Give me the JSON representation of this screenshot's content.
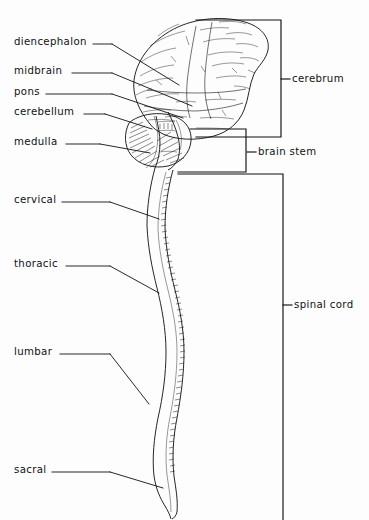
{
  "figure": {
    "background_color": "#fdfdfd",
    "ink_color": "#1a1a1a",
    "width": 369,
    "height": 520
  },
  "left_labels": [
    {
      "id": "diencephalon",
      "text": "diencephalon",
      "x": 14,
      "y": 42,
      "dash_x1": 93,
      "dash_x2": 112,
      "leader": "112,42 179,85"
    },
    {
      "id": "midbrain",
      "text": "midbrain",
      "x": 14,
      "y": 71,
      "dash_x1": 72,
      "dash_x2": 112,
      "leader": "112,71 192,105"
    },
    {
      "id": "pons",
      "text": "pons",
      "x": 14,
      "y": 92,
      "dash_x1": 46,
      "dash_x2": 112,
      "leader": "112,92 183,117"
    },
    {
      "id": "cerebellum",
      "text": "cerebellum",
      "x": 14,
      "y": 112,
      "dash_x1": 84,
      "dash_x2": 105,
      "leader": "105,112 152,128"
    },
    {
      "id": "medulla",
      "text": "medulla",
      "x": 14,
      "y": 142,
      "dash_x1": 66,
      "dash_x2": 100,
      "leader": "100,142 148,152"
    },
    {
      "id": "cervical",
      "text": "cervical",
      "x": 14,
      "y": 200,
      "dash_x1": 62,
      "dash_x2": 110,
      "leader": "110,200 158,218"
    },
    {
      "id": "thoracic",
      "text": "thoracic",
      "x": 14,
      "y": 264,
      "dash_x1": 66,
      "dash_x2": 110,
      "leader": "110,264 158,292"
    },
    {
      "id": "lumbar",
      "text": "lumbar",
      "x": 14,
      "y": 352,
      "dash_x1": 60,
      "dash_x2": 110,
      "leader": "110,352 148,403"
    },
    {
      "id": "sacral",
      "text": "sacral",
      "x": 14,
      "y": 470,
      "dash_x1": 52,
      "dash_x2": 110,
      "leader": "110,470 162,487"
    }
  ],
  "right_labels": [
    {
      "id": "cerebrum",
      "text": "cerebrum",
      "x": 292,
      "y": 79,
      "tick_x1": 281,
      "tick_x2": 290,
      "bracket": "196,20 281,20 281,137 196,137"
    },
    {
      "id": "brain-stem",
      "text": "brain stem",
      "x": 258,
      "y": 152,
      "tick_x1": 247,
      "tick_x2": 256,
      "bracket": "190,129 246,129 246,172 178,172"
    },
    {
      "id": "spinal-cord",
      "text": "spinal cord",
      "x": 294,
      "y": 305,
      "tick_x1": 283,
      "tick_x2": 292,
      "bracket": "178,173 283,173 283,520"
    }
  ]
}
